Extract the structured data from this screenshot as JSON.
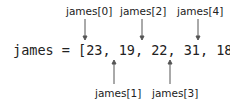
{
  "diagram": {
    "expression": "james = [23, 19, 22, 31, 18]",
    "variable": "james",
    "values": [
      23,
      19,
      22,
      31,
      18
    ],
    "labels_top": [
      "james[0]",
      "james[2]",
      "james[4]"
    ],
    "labels_bottom": [
      "james[1]",
      "james[3]"
    ],
    "arrow_color": "#555555",
    "text_color": "#222222"
  }
}
